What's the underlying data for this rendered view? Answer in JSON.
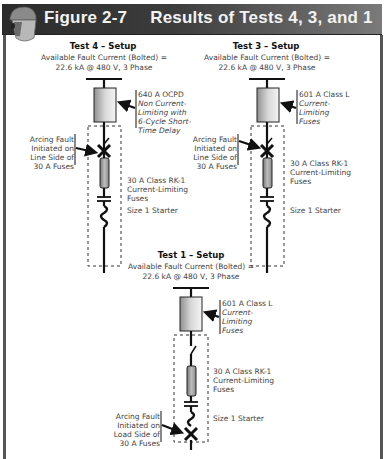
{
  "header": {
    "figure_label": "Figure 2-7",
    "title": "Results of Tests 4, 3, and 1",
    "icon": "face-shield-helmet-icon",
    "colors": {
      "bar_dark": "#2b2b2b",
      "bar_light": "#7a7a7a",
      "text": "#f2f2f2"
    }
  },
  "tests": [
    {
      "id": "test4",
      "title": "Test 4 – Setup",
      "source_line1": "Available Fault Current (Bolted) =",
      "source_line2": "22.6 kA @ 480 V, 3 Phase",
      "ocpd_label": [
        "640 A OCPD",
        "Non Current-",
        "Limiting with",
        "6-Cycle Short-",
        "Time Delay"
      ],
      "fault_label": [
        "Arcing Fault",
        "Initiated on",
        "Line Side of",
        "30 A Fuses"
      ],
      "fuse_label": [
        "30 A Class RK-1",
        "Current-Limiting",
        "Fuses"
      ],
      "starter_label": "Size 1 Starter",
      "fault_position": "line-side"
    },
    {
      "id": "test3",
      "title": "Test 3 – Setup",
      "source_line1": "Available Fault Current (Bolted) =",
      "source_line2": "22.6 kA @ 480 V, 3 Phase",
      "ocpd_label": [
        "601 A Class L",
        "Current-",
        "Limiting",
        "Fuses"
      ],
      "fault_label": [
        "Arcing Fault",
        "Initiated on",
        "Line Side of",
        "30 A Fuses"
      ],
      "fuse_label": [
        "30 A Class RK-1",
        "Current-Limiting",
        "Fuses"
      ],
      "starter_label": "Size 1 Starter",
      "fault_position": "line-side"
    },
    {
      "id": "test1",
      "title": "Test 1 – Setup",
      "source_line1": "Available Fault Current (Bolted) =",
      "source_line2": "22.6 kA @ 480 V, 3 Phase",
      "ocpd_label": [
        "601 A Class L",
        "Current-",
        "Limiting",
        "Fuses"
      ],
      "fault_label": [
        "Arcing Fault",
        "Initiated on",
        "Load Side of",
        "30 A Fuses"
      ],
      "fuse_label": [
        "30 A Class RK-1",
        "Current-Limiting",
        "Fuses"
      ],
      "starter_label": "Size 1 Starter",
      "fault_position": "load-side"
    }
  ]
}
